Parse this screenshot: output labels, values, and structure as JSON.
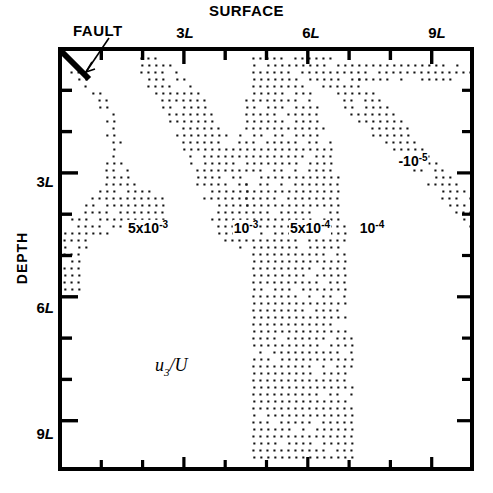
{
  "figure": {
    "top_title": "SURFACE",
    "fault_annotation": "FAULT",
    "y_axis_title": "DEPTH",
    "field_symbol": {
      "base": "u",
      "sub": "3",
      "denominator": "/U"
    }
  },
  "axes": {
    "x": {
      "min_L": 0,
      "max_L": 10,
      "tick_interval_L": 1,
      "labeled_ticks": [
        {
          "value_L": 3,
          "label_num": "3",
          "label_unit": "L"
        },
        {
          "value_L": 6,
          "label_num": "6",
          "label_unit": "L"
        },
        {
          "value_L": 9,
          "label_num": "9",
          "label_unit": "L"
        }
      ]
    },
    "y": {
      "min_L": 0,
      "max_L": 10,
      "tick_interval_L": 1,
      "labeled_ticks": [
        {
          "value_L": 3,
          "label_num": "3",
          "label_unit": "L"
        },
        {
          "value_L": 6,
          "label_num": "6",
          "label_unit": "L"
        },
        {
          "value_L": 9,
          "label_num": "9",
          "label_unit": "L"
        }
      ]
    }
  },
  "contour_labels": [
    {
      "id": "c-5e3",
      "mantissa": "5x10",
      "exponent": "-3",
      "prefix": "",
      "x_px": 148,
      "y_px": 228
    },
    {
      "id": "c-1e3",
      "mantissa": "10",
      "exponent": "-3",
      "prefix": "",
      "x_px": 246,
      "y_px": 228
    },
    {
      "id": "c-5e4",
      "mantissa": "5x10",
      "exponent": "-4",
      "prefix": "",
      "x_px": 310,
      "y_px": 228
    },
    {
      "id": "c-1e4",
      "mantissa": "10",
      "exponent": "-4",
      "prefix": "",
      "x_px": 372,
      "y_px": 228
    },
    {
      "id": "c-1e5",
      "mantissa": "10",
      "exponent": "-5",
      "prefix": "-",
      "x_px": 413,
      "y_px": 161
    }
  ],
  "chart_data": {
    "type": "contour",
    "title": "SURFACE",
    "xlabel": "",
    "ylabel": "DEPTH",
    "quantity": "u3/U",
    "xlim": [
      0,
      10
    ],
    "ylim": [
      0,
      10
    ],
    "x_unit": "L",
    "y_unit": "L",
    "y_direction": "downward",
    "grid": false,
    "legend": "none",
    "shading": "stipple-dot-bands",
    "annotations": [
      {
        "text": "FAULT",
        "points_to_px": [
          84,
          74
        ],
        "type": "leader-arrow"
      }
    ],
    "fault_segment_px": [
      [
        60,
        50
      ],
      [
        89,
        79
      ]
    ],
    "contour_levels": [
      0.005,
      0.001,
      0.0005,
      0.0001,
      1e-05
    ],
    "contour_level_labels": [
      "5x10^-3",
      "10^-3",
      "5x10^-4",
      "10^-4",
      "10^-5"
    ],
    "stipple_bands": [
      {
        "level_label": "5x10^-3",
        "description": "Band nearest the fault; narrow near surface, widening and turning left toward the depth axis below 3L.",
        "polygon_L": [
          [
            0.05,
            0.45
          ],
          [
            0.55,
            0.45
          ],
          [
            1.25,
            1.35
          ],
          [
            1.55,
            2.3
          ],
          [
            1.75,
            3.2
          ],
          [
            2.3,
            3.45
          ],
          [
            2.55,
            3.6
          ],
          [
            2.6,
            4.15
          ],
          [
            2.2,
            4.3
          ],
          [
            1.55,
            4.35
          ],
          [
            0.95,
            4.55
          ],
          [
            0.6,
            5.05
          ],
          [
            0.55,
            5.55
          ],
          [
            0.5,
            5.95
          ],
          [
            0.05,
            5.95
          ],
          [
            0.05,
            5.1
          ],
          [
            0.05,
            4.35
          ],
          [
            0.55,
            3.85
          ],
          [
            1.05,
            3.25
          ],
          [
            1.2,
            2.35
          ],
          [
            1.0,
            1.45
          ],
          [
            0.55,
            0.9
          ]
        ]
      },
      {
        "level_label": "10^-3",
        "description": "Second band, diagonal from surface near 2L sloping down-right, broadening to the 5x10^-4 region.",
        "polygon_L": [
          [
            1.85,
            0.2
          ],
          [
            2.6,
            0.2
          ],
          [
            3.45,
            1.1
          ],
          [
            4.1,
            2.15
          ],
          [
            4.55,
            3.2
          ],
          [
            4.7,
            4.05
          ],
          [
            4.6,
            4.75
          ],
          [
            4.2,
            4.85
          ],
          [
            3.75,
            4.35
          ],
          [
            3.4,
            3.45
          ],
          [
            2.95,
            2.4
          ],
          [
            2.4,
            1.35
          ],
          [
            1.95,
            0.6
          ]
        ]
      },
      {
        "level_label": "5x10^-4",
        "description": "Third band; steep column that widens strongly with depth and reaches the bottom of the frame near 5L-7L.",
        "polygon_L": [
          [
            4.55,
            0.15
          ],
          [
            5.4,
            0.15
          ],
          [
            6.1,
            1.05
          ],
          [
            6.55,
            2.15
          ],
          [
            6.8,
            3.25
          ],
          [
            6.9,
            4.35
          ],
          [
            7.0,
            5.45
          ],
          [
            7.05,
            6.55
          ],
          [
            7.1,
            7.65
          ],
          [
            7.15,
            8.75
          ],
          [
            7.15,
            9.95
          ],
          [
            4.7,
            9.95
          ],
          [
            4.6,
            8.85
          ],
          [
            4.55,
            7.7
          ],
          [
            4.55,
            6.55
          ],
          [
            4.6,
            5.4
          ],
          [
            4.6,
            4.3
          ],
          [
            4.45,
            3.2
          ],
          [
            4.25,
            2.1
          ],
          [
            4.55,
            1.05
          ]
        ]
      },
      {
        "level_label": "10^-4",
        "description": "Fourth band, shallow diagonal from near 5L at the surface to the right frame edge around 4L depth.",
        "polygon_L": [
          [
            5.55,
            0.1
          ],
          [
            6.6,
            0.1
          ],
          [
            7.55,
            0.95
          ],
          [
            8.4,
            1.85
          ],
          [
            9.2,
            2.75
          ],
          [
            9.95,
            3.55
          ],
          [
            9.95,
            4.35
          ],
          [
            9.2,
            3.65
          ],
          [
            8.35,
            2.8
          ],
          [
            7.45,
            1.95
          ],
          [
            6.55,
            1.1
          ],
          [
            5.8,
            0.55
          ]
        ]
      },
      {
        "level_label": "10^-5",
        "description": "Faint near-horizontal band in the upper right, just below the surface, extending to the right frame edge.",
        "polygon_L": [
          [
            6.85,
            0.3
          ],
          [
            9.95,
            0.3
          ],
          [
            9.95,
            0.85
          ],
          [
            7.35,
            0.85
          ],
          [
            6.95,
            0.6
          ]
        ]
      }
    ]
  }
}
